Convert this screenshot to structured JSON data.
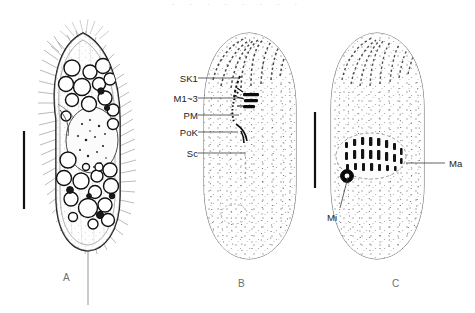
{
  "figure": {
    "background_color": "#ffffff",
    "width": 475,
    "height": 313,
    "ink_color": "#1a1a1a",
    "stipple_color": "#7a7a7a",
    "leader_color": "#3a3a3a",
    "panel_letter_color": "#6e6e6e",
    "top_cropped_text": "· · · · · · · ·"
  },
  "panels": [
    {
      "id": "panel-a",
      "letter": "A",
      "letter_x": 63,
      "letter_y": 272,
      "description": "live specimen, ventral view with cilia and food vacuoles",
      "has_scale_bar": true
    },
    {
      "id": "panel-b",
      "letter": "B",
      "letter_x": 238,
      "letter_y": 278,
      "description": "ventral infraciliature with oral structures",
      "has_scale_bar": false
    },
    {
      "id": "panel-c",
      "letter": "C",
      "letter_x": 392,
      "letter_y": 278,
      "description": "dorsal infraciliature with nuclear apparatus",
      "has_scale_bar": true
    }
  ],
  "labels": [
    {
      "id": "label-sk1",
      "text": "SK1",
      "x": 168,
      "y": 73,
      "anchor": "right",
      "leader_from_x": 198,
      "leader_from_y": 78,
      "leader_to_x": 240,
      "leader_to_y": 78
    },
    {
      "id": "label-m13",
      "text": "M1~3",
      "x": 164,
      "y": 93,
      "anchor": "right",
      "leader_from_x": 198,
      "leader_from_y": 98,
      "leader_to_x": 243,
      "leader_to_y": 98
    },
    {
      "id": "label-pm",
      "text": "PM",
      "x": 172,
      "y": 110,
      "anchor": "right",
      "leader_from_x": 198,
      "leader_from_y": 115,
      "leader_to_x": 239,
      "leader_to_y": 115
    },
    {
      "id": "label-pok",
      "text": "PoK",
      "x": 169,
      "y": 127,
      "anchor": "right",
      "leader_from_x": 198,
      "leader_from_y": 132,
      "leader_to_x": 238,
      "leader_to_y": 132
    },
    {
      "id": "label-sc",
      "text": "Sc",
      "x": 176,
      "y": 148,
      "anchor": "right",
      "leader_from_x": 198,
      "leader_from_y": 153,
      "leader_to_x": 245,
      "leader_to_y": 153
    },
    {
      "id": "label-ma",
      "text": "Ma",
      "x": 449,
      "y": 158,
      "anchor": "left",
      "leader_from_x": 406,
      "leader_from_y": 163,
      "leader_to_x": 445,
      "leader_to_y": 163
    },
    {
      "id": "label-mi",
      "text": "Mi",
      "x": 327,
      "y": 212,
      "anchor": "left",
      "leader_from_x": 340,
      "leader_from_y": 208,
      "leader_to_x": 347,
      "leader_to_y": 176
    }
  ],
  "scale_bars": [
    {
      "id": "scale-bar-a",
      "x": 24,
      "y_top": 131,
      "y_bottom": 209,
      "thickness": 2.2
    },
    {
      "id": "scale-bar-c",
      "x": 315,
      "y_top": 112,
      "y_bottom": 188,
      "thickness": 2.2
    }
  ]
}
